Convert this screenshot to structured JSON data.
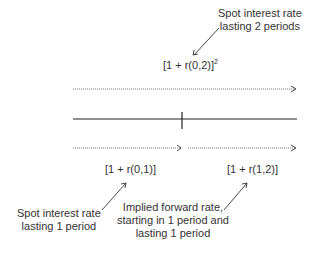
{
  "top_note": {
    "line1": "Spot interest rate",
    "line2": "lasting 2 periods"
  },
  "top_formula": {
    "text": "[1 + r(0,2)]",
    "exponent": "2"
  },
  "left_formula": "[1 + r(0,1)]",
  "right_formula": "[1 + r(1,2)]",
  "left_note": {
    "line1": "Spot interest rate",
    "line2": "lasting 1 period"
  },
  "right_note": {
    "line1": "Implied forward rate,",
    "line2": "starting in 1 period and",
    "line3": "lasting 1 period"
  }
}
